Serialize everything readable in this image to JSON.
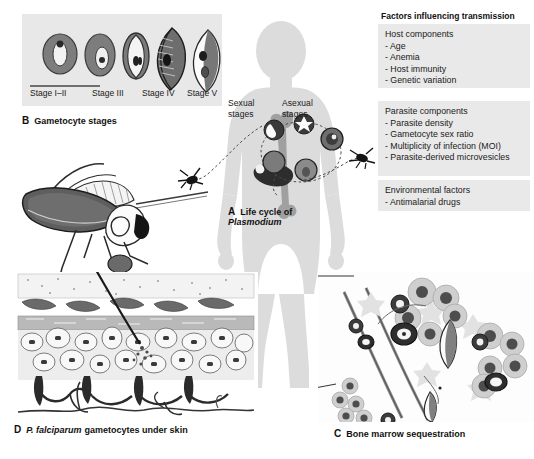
{
  "figure": {
    "background": "#ffffff"
  },
  "panelB": {
    "letter": "B",
    "caption": "Gametocyte stages",
    "box_color": "#e8e8e8",
    "stages": [
      {
        "label": "Stage I–II",
        "x": 32
      },
      {
        "label": "Stage III",
        "x": 93
      },
      {
        "label": "Stage IV",
        "x": 140
      },
      {
        "label": "Stage V",
        "x": 180
      }
    ]
  },
  "panelA": {
    "letter": "A",
    "caption_line1": "Life cycle of",
    "caption_line2": "Plasmodium",
    "label_sexual_line1": "Sexual",
    "label_sexual_line2": "stages",
    "label_asexual_line1": "Asexual",
    "label_asexual_line2": "stages",
    "body_color": "#dcdcdc",
    "bone_color": "#9a9a9a"
  },
  "panelC": {
    "letter": "C",
    "caption": "Bone marrow sequestration"
  },
  "panelD": {
    "letter": "D",
    "caption_italic": "P. falciparum",
    "caption_rest": "gametocytes under skin"
  },
  "factors": {
    "title": "Factors influencing transmission",
    "groups": [
      {
        "heading": "Host components",
        "items": [
          "- Age",
          "- Anemia",
          "- Host immunity",
          "- Genetic variation"
        ]
      },
      {
        "heading": "Parasite components",
        "items": [
          "- Parasite density",
          "- Gametocyte sex ratio",
          "- Multiplicity of infection (MOI)",
          "- Parasite-derived microvesicles"
        ]
      },
      {
        "heading": "Environmental factors",
        "items": [
          "- Antimalarial drugs"
        ]
      }
    ],
    "box_color": "#e9e9e9"
  }
}
